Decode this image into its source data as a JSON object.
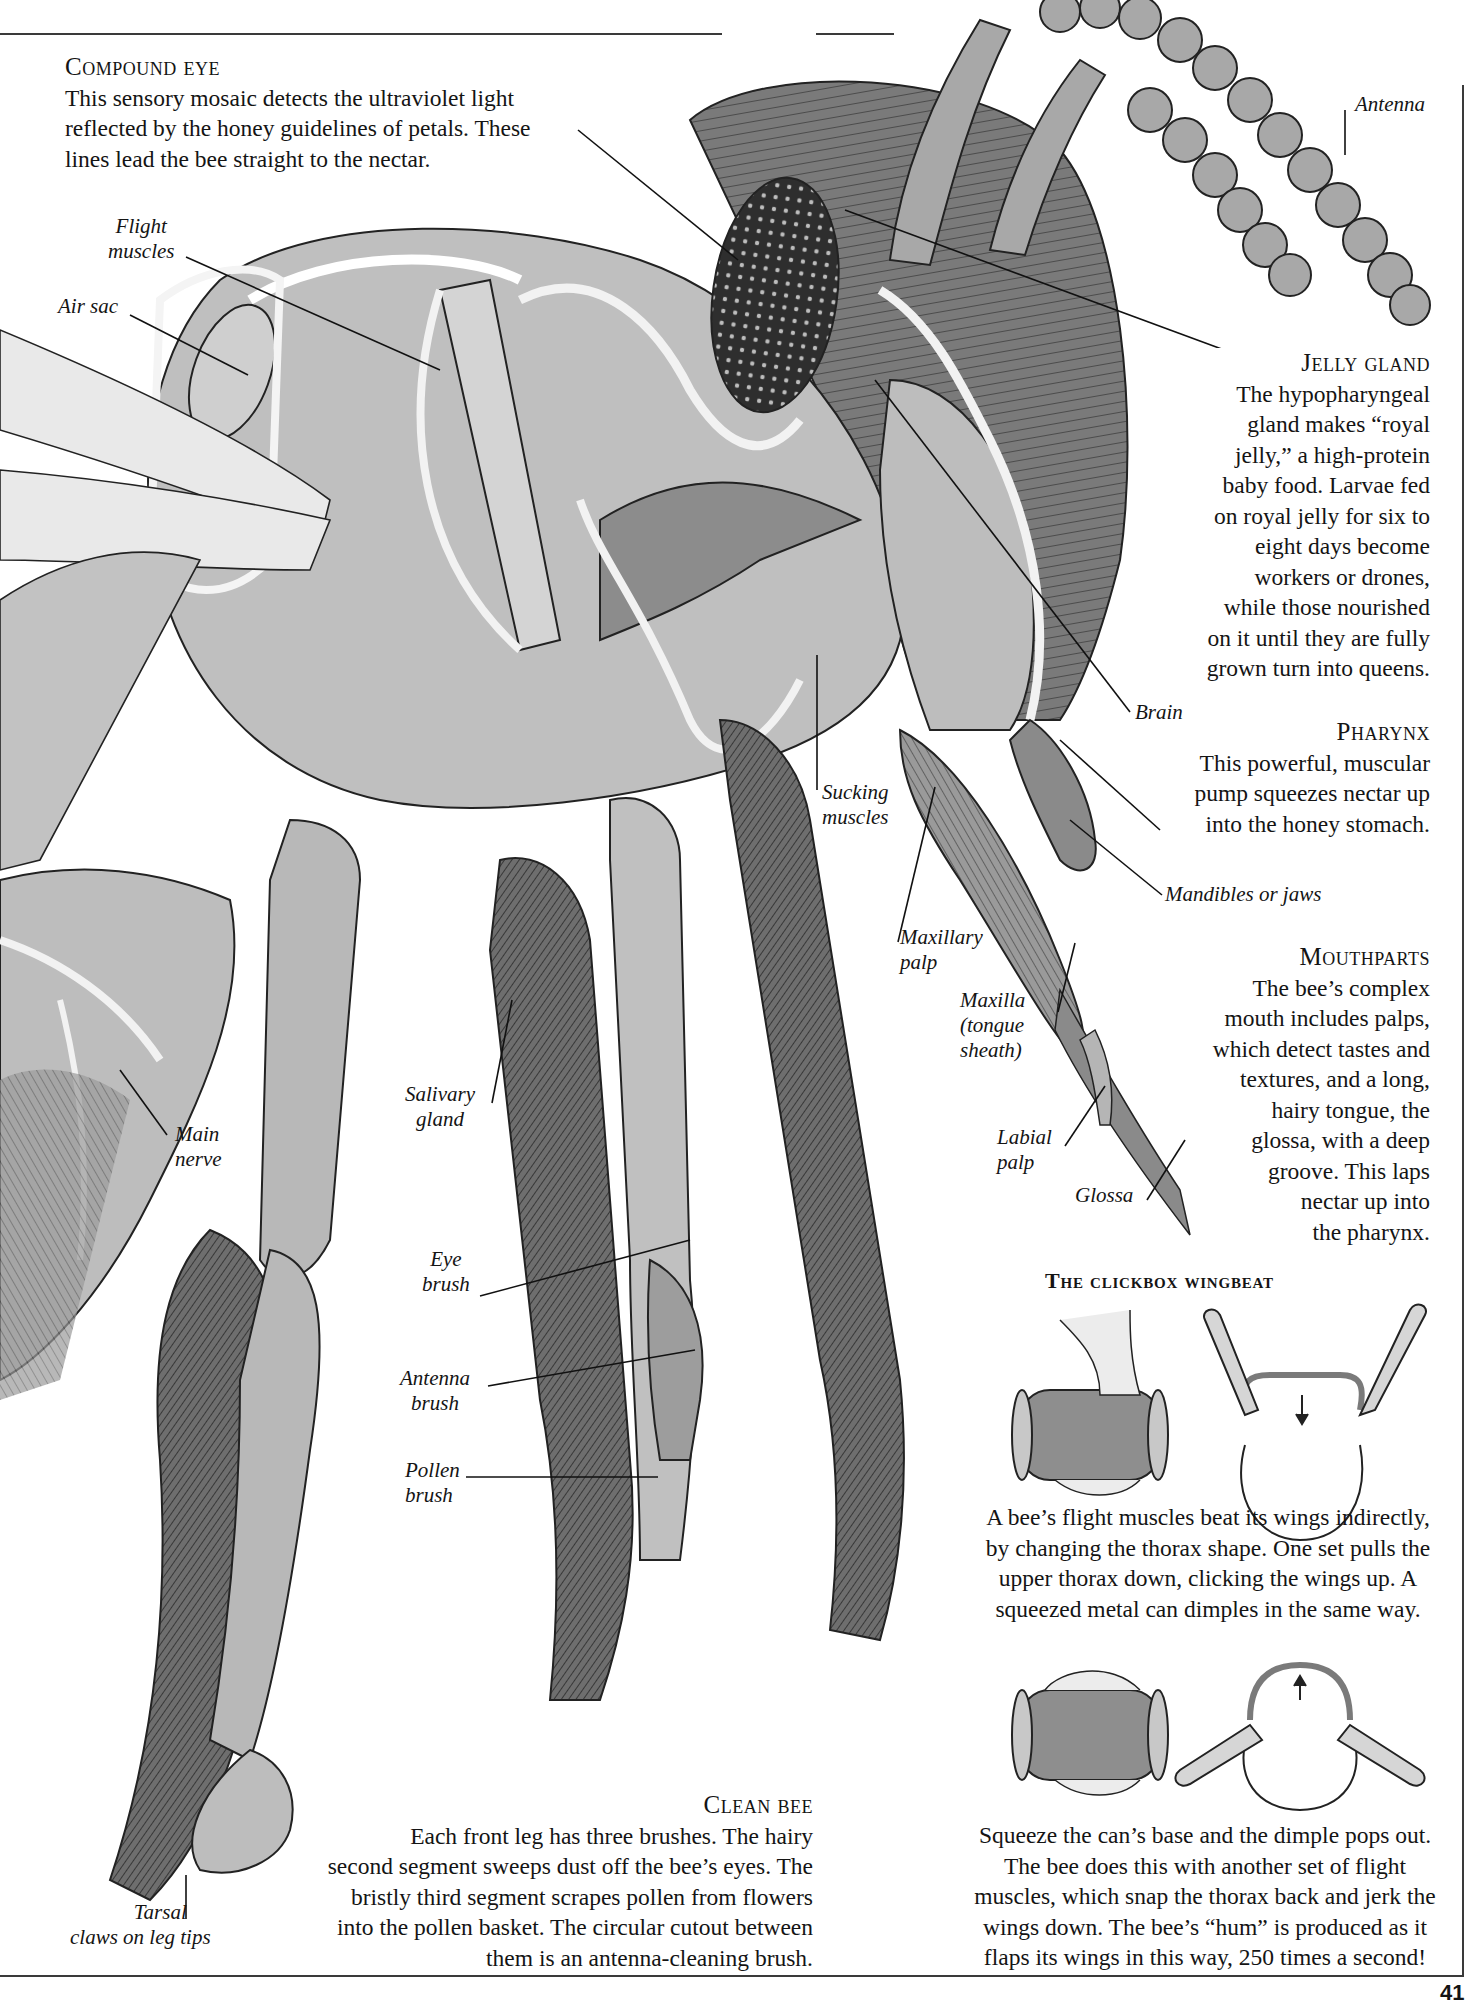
{
  "page": {
    "number": "41",
    "colors": {
      "ink": "#141414",
      "rule": "#3a3a3a",
      "shade_dark": "#5a5a5a",
      "shade_mid": "#9a9a9a",
      "shade_light": "#cfcfcf",
      "paper": "#ffffff"
    }
  },
  "captions": {
    "compound_eye": {
      "title": "Compound eye",
      "lines": [
        "This sensory mosaic detects the ultraviolet light",
        "reflected by the honey guidelines of petals. These",
        "lines lead the bee straight to the nectar."
      ]
    },
    "jelly_gland": {
      "title": "Jelly gland",
      "lines": [
        "The hypopharyngeal",
        "gland makes “royal",
        "jelly,” a high-protein",
        "baby food. Larvae fed",
        "on royal jelly for six to",
        "eight days become",
        "workers or drones,",
        "while those nourished",
        "on it until they are fully",
        "grown turn into queens."
      ]
    },
    "pharynx": {
      "title": "Pharynx",
      "lines": [
        "This powerful, muscular",
        "pump squeezes nectar up",
        "into the honey stomach."
      ]
    },
    "mouthparts": {
      "title": "Mouthparts",
      "lines": [
        "The bee’s complex",
        "mouth includes palps,",
        "which detect tastes and",
        "textures, and a long,",
        "hairy tongue, the",
        "glossa, with a deep",
        "groove. This laps",
        "nectar up into",
        "the pharynx."
      ]
    },
    "clean_bee": {
      "title": "Clean bee",
      "lines": [
        "Each front leg has three brushes. The hairy",
        "second segment sweeps dust off the bee’s eyes. The",
        "bristly third segment scrapes pollen from flowers",
        "into the pollen basket. The circular cutout between",
        "them is an antenna-cleaning brush."
      ]
    }
  },
  "labels": {
    "antenna": "Antenna",
    "flight_muscles": [
      "Flight",
      "muscles"
    ],
    "air_sac": "Air sac",
    "brain": "Brain",
    "sucking_muscles": [
      "Sucking",
      "muscles"
    ],
    "mandibles": "Mandibles or jaws",
    "maxillary_palp": [
      "Maxillary",
      "palp"
    ],
    "maxilla": [
      "Maxilla",
      "(tongue",
      "sheath)"
    ],
    "main_nerve": [
      "Main",
      "nerve"
    ],
    "salivary_gland": [
      "Salivary",
      "gland"
    ],
    "labial_palp": [
      "Labial",
      "palp"
    ],
    "glossa": "Glossa",
    "eye_brush": [
      "Eye",
      "brush"
    ],
    "antenna_brush": [
      "Antenna",
      "brush"
    ],
    "pollen_brush": [
      "Pollen",
      "brush"
    ],
    "tarsal_claws": [
      "Tarsal",
      "claws on leg tips"
    ]
  },
  "clickbox": {
    "title": "The clickbox wingbeat",
    "text_up": [
      "A bee’s flight muscles beat its wings indirectly,",
      "by changing the thorax shape. One set pulls the",
      "upper thorax down, clicking the wings up. A",
      "squeezed metal can dimples in the same way."
    ],
    "text_down": [
      "Squeeze the can’s base and the dimple pops out.",
      "The bee does this with another set of flight",
      "muscles, which snap the thorax back and jerk the",
      "wings down. The bee’s “hum” is produced as it",
      "flaps its wings in this way, 250 times a second!"
    ]
  }
}
